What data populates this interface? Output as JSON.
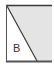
{
  "diagram": {
    "label": "B",
    "colors": {
      "stroke": "#3a3a3a",
      "shade": "#e4e4e4",
      "background": "#ffffff"
    }
  }
}
